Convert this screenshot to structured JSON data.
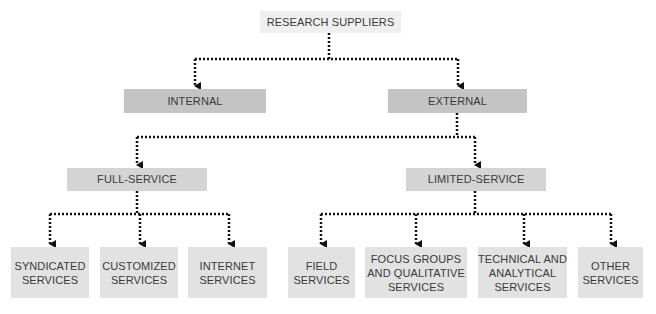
{
  "diagram": {
    "colors": {
      "root_fill": "#efefef",
      "level1_fill": "#c4c4c4",
      "level2_fill": "#d4d4d4",
      "leaf_fill": "#e2e2e2",
      "text": "#3a3a3a",
      "connector": "#111111"
    },
    "connector_style": "dotted-arrow",
    "root": {
      "id": "root",
      "label": "RESEARCH SUPPLIERS"
    },
    "level1": [
      {
        "id": "internal",
        "label": "INTERNAL",
        "parent": "root"
      },
      {
        "id": "external",
        "label": "EXTERNAL",
        "parent": "root"
      }
    ],
    "level2": [
      {
        "id": "full",
        "label": "FULL-SERVICE",
        "parent": "external"
      },
      {
        "id": "limited",
        "label": "LIMITED-SERVICE",
        "parent": "external"
      }
    ],
    "leaves": [
      {
        "id": "syndicated",
        "label": "SYNDICATED\nSERVICES",
        "parent": "full"
      },
      {
        "id": "customized",
        "label": "CUSTOMIZED\nSERVICES",
        "parent": "full"
      },
      {
        "id": "internet",
        "label": "INTERNET\nSERVICES",
        "parent": "full"
      },
      {
        "id": "field",
        "label": "FIELD\nSERVICES",
        "parent": "limited"
      },
      {
        "id": "focus",
        "label": "FOCUS GROUPS\nAND QUALITATIVE\nSERVICES",
        "parent": "limited"
      },
      {
        "id": "technical",
        "label": "TECHNICAL AND\nANALYTICAL\nSERVICES",
        "parent": "limited"
      },
      {
        "id": "other",
        "label": "OTHER\nSERVICES",
        "parent": "limited"
      }
    ]
  }
}
